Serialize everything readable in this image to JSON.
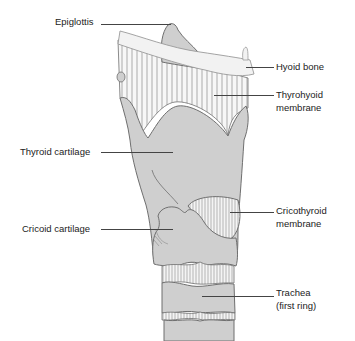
{
  "diagram": {
    "colors": {
      "cartilage_fill": "#cfcfcf",
      "outline": "#6f6f6f",
      "bone_fill": "#f2f2f2",
      "membrane_fill": "#f7f7f7",
      "text": "#222222"
    },
    "labels": {
      "epiglottis": "Epiglottis",
      "hyoid_bone": "Hyoid bone",
      "thyrohyoid_line1": "Thyrohyoid",
      "thyrohyoid_line2": "membrane",
      "thyroid_cartilage": "Thyroid cartilage",
      "cricoid_cartilage": "Cricoid cartilage",
      "cricothyroid_line1": "Cricothyroid",
      "cricothyroid_line2": "membrane",
      "trachea_line1": "Trachea",
      "trachea_line2": "(first ring)"
    }
  }
}
